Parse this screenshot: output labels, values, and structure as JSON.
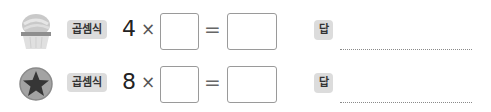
{
  "problems": [
    {
      "icon": "cupcake-icon",
      "label": "곱셈식",
      "multiplicand": "4",
      "times_sign": "×",
      "equals_sign": "=",
      "factor_value": "",
      "product_value": "",
      "answer_label": "답",
      "answer_value": ""
    },
    {
      "icon": "star-icon",
      "label": "곱셈식",
      "multiplicand": "8",
      "times_sign": "×",
      "equals_sign": "=",
      "factor_value": "",
      "product_value": "",
      "answer_label": "답",
      "answer_value": ""
    }
  ],
  "colors": {
    "badge_bg": "#dcdcdc",
    "box_border": "#9a9a9a",
    "star_fill": "#3a3a3a",
    "star_circle": "#9c9c9c"
  }
}
